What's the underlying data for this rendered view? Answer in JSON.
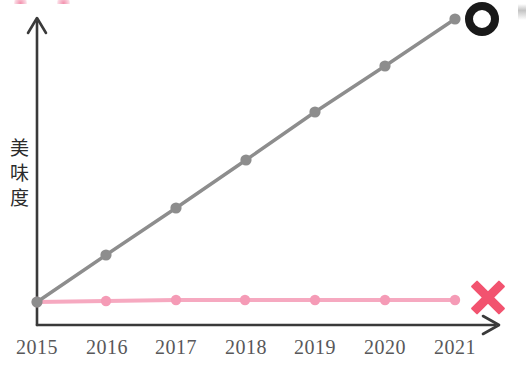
{
  "chart_data": {
    "type": "line",
    "title": "",
    "xlabel": "",
    "ylabel": "美味度",
    "categories": [
      "2015",
      "2016",
      "2017",
      "2018",
      "2019",
      "2020",
      "2021"
    ],
    "x": [
      2015,
      2016,
      2017,
      2018,
      2019,
      2020,
      2021
    ],
    "xlim": [
      2015,
      2021
    ],
    "ylim": [
      0,
      100
    ],
    "grid": false,
    "legend": null,
    "series": [
      {
        "name": "rising",
        "color": "#8d8d8d",
        "marker": "circle",
        "values": [
          0,
          17,
          33,
          50,
          67,
          83,
          100
        ]
      },
      {
        "name": "flat",
        "color": "#f6a9c0",
        "marker": "circle",
        "values": [
          0,
          0,
          0,
          0,
          0,
          0,
          0
        ]
      }
    ],
    "annotations": [
      {
        "name": "circle-mark",
        "symbol": "○",
        "meaning": "good",
        "color": "#191919"
      },
      {
        "name": "cross-mark",
        "symbol": "✕",
        "meaning": "bad",
        "color": "#f2536f"
      }
    ]
  },
  "axes": {
    "y_label_text": "美味度",
    "y_label_chars": [
      "美",
      "味",
      "度"
    ],
    "x_tick_labels": [
      "2015",
      "2016",
      "2017",
      "2018",
      "2019",
      "2020",
      "2021"
    ],
    "axis_color": "#3a3a3a",
    "arrow_y": "up",
    "arrow_x": "right"
  },
  "marks": {
    "circle_symbol": "○",
    "cross_symbol": "✕"
  },
  "colors": {
    "background": "#ffffff",
    "gray_series": "#8d8d8d",
    "pink_series": "#f6a9c0",
    "pink_marker": "#f59bb6",
    "cross": "#f2536f",
    "circle": "#191919",
    "tick_text": "#58585a",
    "label_text": "#2b2b2b"
  }
}
